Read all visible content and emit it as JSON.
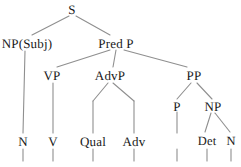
{
  "diagram": {
    "type": "syntax-tree",
    "stroke_color": "#8a8a8a",
    "text_color": "#1a1a1a",
    "background_color": "#ffffff",
    "nodes": [
      {
        "id": "s",
        "label": "S",
        "x": 72,
        "y": 9
      },
      {
        "id": "np_subj",
        "label": "NP(Subj)",
        "x": 27,
        "y": 43
      },
      {
        "id": "pred_p",
        "label": "Pred P",
        "x": 116,
        "y": 43
      },
      {
        "id": "vp",
        "label": "VP",
        "x": 52,
        "y": 75
      },
      {
        "id": "advp",
        "label": "AdvP",
        "x": 110,
        "y": 75
      },
      {
        "id": "pp",
        "label": "PP",
        "x": 194,
        "y": 75
      },
      {
        "id": "p",
        "label": "P",
        "x": 177,
        "y": 106
      },
      {
        "id": "np_obj",
        "label": "NP",
        "x": 213,
        "y": 106
      },
      {
        "id": "n1",
        "label": "N",
        "x": 23,
        "y": 141
      },
      {
        "id": "v",
        "label": "V",
        "x": 53,
        "y": 141
      },
      {
        "id": "qual",
        "label": "Qual",
        "x": 93,
        "y": 141
      },
      {
        "id": "adv",
        "label": "Adv",
        "x": 134,
        "y": 141
      },
      {
        "id": "det",
        "label": "Det",
        "x": 207,
        "y": 141
      },
      {
        "id": "n2",
        "label": "N",
        "x": 231,
        "y": 141
      }
    ],
    "edges": [
      {
        "from": "s",
        "to": "np_subj",
        "kind": "branch"
      },
      {
        "from": "s",
        "to": "pred_p",
        "kind": "branch"
      },
      {
        "from": "pred_p",
        "to": "vp",
        "kind": "branch"
      },
      {
        "from": "pred_p",
        "to": "advp",
        "kind": "vertical"
      },
      {
        "from": "pred_p",
        "to": "pp",
        "kind": "branch"
      },
      {
        "from": "np_subj",
        "to": "n1",
        "kind": "vertical"
      },
      {
        "from": "vp",
        "to": "v",
        "kind": "vertical"
      },
      {
        "from": "advp",
        "to": "qual",
        "kind": "branch-vertical"
      },
      {
        "from": "advp",
        "to": "adv",
        "kind": "branch-vertical"
      },
      {
        "from": "pp",
        "to": "p",
        "kind": "branch"
      },
      {
        "from": "pp",
        "to": "np_obj",
        "kind": "branch"
      },
      {
        "from": "p",
        "to": "p-stub",
        "kind": "vertical"
      },
      {
        "from": "np_obj",
        "to": "det",
        "kind": "branch"
      },
      {
        "from": "np_obj",
        "to": "n2",
        "kind": "branch"
      }
    ],
    "terminal_stubs": [
      {
        "label_for": "n1",
        "x": 23
      },
      {
        "label_for": "v",
        "x": 53
      },
      {
        "label_for": "qual",
        "x": 93
      },
      {
        "label_for": "adv",
        "x": 134
      },
      {
        "label_for": "p",
        "x": 177
      },
      {
        "label_for": "det",
        "x": 207
      },
      {
        "label_for": "n2",
        "x": 231
      }
    ]
  }
}
